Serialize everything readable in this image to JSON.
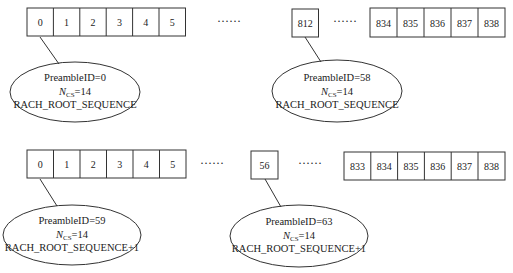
{
  "diagram": {
    "type": "preamble-to-root-sequence-mapping",
    "rows": [
      {
        "left_group": [
          "0",
          "1",
          "2",
          "3",
          "4",
          "5"
        ],
        "ellipsis_1": "······",
        "middle_cell": "812",
        "ellipsis_2": "······",
        "right_group": [
          "834",
          "835",
          "836",
          "837",
          "838"
        ],
        "callouts": [
          {
            "line1": "PreambleID=0",
            "ncs_symbol": "N",
            "ncs_sub": "CS",
            "ncs_value": "=14",
            "line3": "RACH_ROOT_SEQUENCE"
          },
          {
            "line1": "PreambleID=58",
            "ncs_symbol": "N",
            "ncs_sub": "CS",
            "ncs_value": "=14",
            "line3": "RACH_ROOT_SEQUENCE"
          }
        ]
      },
      {
        "left_group": [
          "0",
          "1",
          "2",
          "3",
          "4",
          "5"
        ],
        "ellipsis_1": "······",
        "middle_cell": "56",
        "ellipsis_2": "······",
        "right_group": [
          "833",
          "834",
          "835",
          "836",
          "837",
          "838"
        ],
        "callouts": [
          {
            "line1": "PreambleID=59",
            "ncs_symbol": "N",
            "ncs_sub": "CS",
            "ncs_value": "=14",
            "line3": "RACH_ROOT_SEQUENCE+1"
          },
          {
            "line1": "PreambleID=63",
            "ncs_symbol": "N",
            "ncs_sub": "CS",
            "ncs_value": "=14",
            "line3": "RACH_ROOT_SEQUENCE+1"
          }
        ]
      }
    ]
  }
}
